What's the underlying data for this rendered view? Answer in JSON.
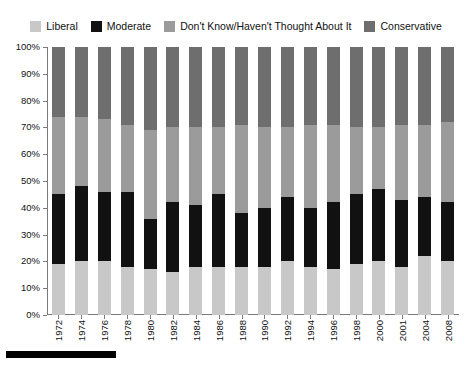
{
  "legend": {
    "items": [
      {
        "label": "Liberal",
        "color": "#c8c8c8",
        "icon": "legend-swatch-icon"
      },
      {
        "label": "Moderate",
        "color": "#111111",
        "icon": "legend-swatch-icon"
      },
      {
        "label": "Don't Know/Haven't Thought About It",
        "color": "#9b9b9b",
        "icon": "legend-swatch-icon"
      },
      {
        "label": "Conservative",
        "color": "#6e6e6e",
        "icon": "legend-swatch-icon"
      }
    ]
  },
  "axis": {
    "y_ticks": [
      "0%",
      "10%",
      "20%",
      "30%",
      "40%",
      "50%",
      "60%",
      "70%",
      "80%",
      "90%",
      "100%"
    ]
  },
  "chart_data": {
    "type": "bar",
    "stacked": true,
    "stacked_normalized": true,
    "title": "",
    "subtitle": "",
    "xlabel": "",
    "ylabel": "",
    "ylim": [
      0,
      100
    ],
    "ytick_step": 10,
    "grid": false,
    "legend_position": "top",
    "categories": [
      "1972",
      "1974",
      "1976",
      "1978",
      "1980",
      "1982",
      "1984",
      "1986",
      "1988",
      "1990",
      "1992",
      "1994",
      "1996",
      "1998",
      "2000",
      "2001",
      "2004",
      "2008"
    ],
    "series": [
      {
        "name": "Liberal",
        "color": "#c8c8c8",
        "values": [
          19,
          20,
          20,
          18,
          17,
          16,
          18,
          18,
          18,
          18,
          20,
          18,
          17,
          19,
          20,
          18,
          22,
          20
        ]
      },
      {
        "name": "Moderate",
        "color": "#111111",
        "values": [
          26,
          28,
          26,
          28,
          19,
          26,
          23,
          27,
          20,
          22,
          24,
          22,
          25,
          26,
          27,
          25,
          22,
          22
        ]
      },
      {
        "name": "Don't Know/Haven't Thought About It",
        "color": "#9b9b9b",
        "values": [
          29,
          26,
          27,
          25,
          33,
          28,
          29,
          25,
          33,
          30,
          26,
          31,
          29,
          25,
          23,
          28,
          27,
          30
        ]
      },
      {
        "name": "Conservative",
        "color": "#6e6e6e",
        "values": [
          26,
          26,
          27,
          29,
          31,
          30,
          30,
          30,
          29,
          30,
          30,
          29,
          29,
          30,
          30,
          29,
          29,
          28
        ]
      }
    ]
  }
}
